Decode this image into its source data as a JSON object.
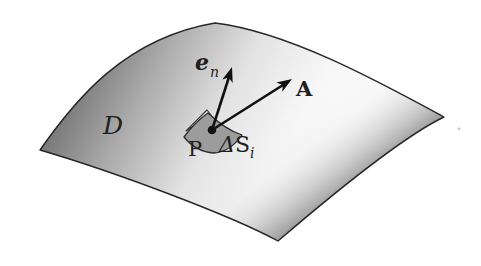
{
  "figure": {
    "background_color": "#ffffff",
    "ink_color": "#1f1f1f",
    "surface": {
      "region_label": "D",
      "shade_dark": "#6a6a6a",
      "shade_light": "#fbfbfb",
      "edge_color": "#262626"
    },
    "patch": {
      "fill": "#9c9c9c",
      "label_delta": "Δ",
      "label_main": "S",
      "label_sub": "i"
    },
    "point": {
      "label": "P",
      "marker": "filled-dot"
    },
    "vectors": {
      "normal": {
        "base": "e",
        "sub": "n",
        "style": "arrow"
      },
      "field": {
        "label": "A",
        "style": "arrow"
      }
    }
  }
}
